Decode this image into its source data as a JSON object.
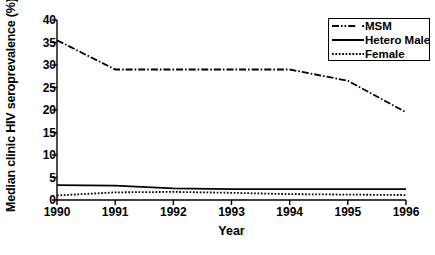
{
  "chart_data": {
    "type": "line",
    "title": "",
    "xlabel": "Year",
    "ylabel": "Median clinic HIV seroprevalence (%)",
    "categories": [
      1990,
      1991,
      1992,
      1993,
      1994,
      1995,
      1996
    ],
    "x": [
      1990,
      1991,
      1992,
      1993,
      1994,
      1995,
      1996
    ],
    "xlim": [
      1990,
      1996
    ],
    "ylim": [
      0,
      40
    ],
    "yticks": [
      0,
      5,
      10,
      15,
      20,
      25,
      30,
      35,
      40
    ],
    "xticks": [
      1990,
      1991,
      1992,
      1993,
      1994,
      1995,
      1996
    ],
    "xtick_labels": [
      "1990",
      "1991",
      "1992",
      "1993",
      "1994",
      "1995",
      "1996"
    ],
    "ytick_labels": [
      "0",
      "5",
      "10",
      "15",
      "20",
      "25",
      "30",
      "35",
      "40"
    ],
    "grid": false,
    "legend_position": "top-right",
    "series": [
      {
        "name": "MSM",
        "style": "dash-dot",
        "color": "#000000",
        "values": [
          35.5,
          29.0,
          29.0,
          29.0,
          29.0,
          26.5,
          19.5
        ]
      },
      {
        "name": "Hetero Male",
        "style": "solid",
        "color": "#000000",
        "values": [
          3.3,
          3.2,
          2.6,
          2.4,
          2.4,
          2.4,
          2.4
        ]
      },
      {
        "name": "Female",
        "style": "dotted",
        "color": "#000000",
        "values": [
          1.0,
          1.7,
          1.8,
          1.6,
          1.3,
          1.2,
          1.1
        ]
      }
    ]
  },
  "legend": {
    "entries": [
      {
        "label": "MSM"
      },
      {
        "label": "Hetero Male"
      },
      {
        "label": "Female"
      }
    ]
  },
  "axes": {
    "y_title": "Median clinic HIV seroprevalence (%)",
    "x_title": "Year"
  }
}
